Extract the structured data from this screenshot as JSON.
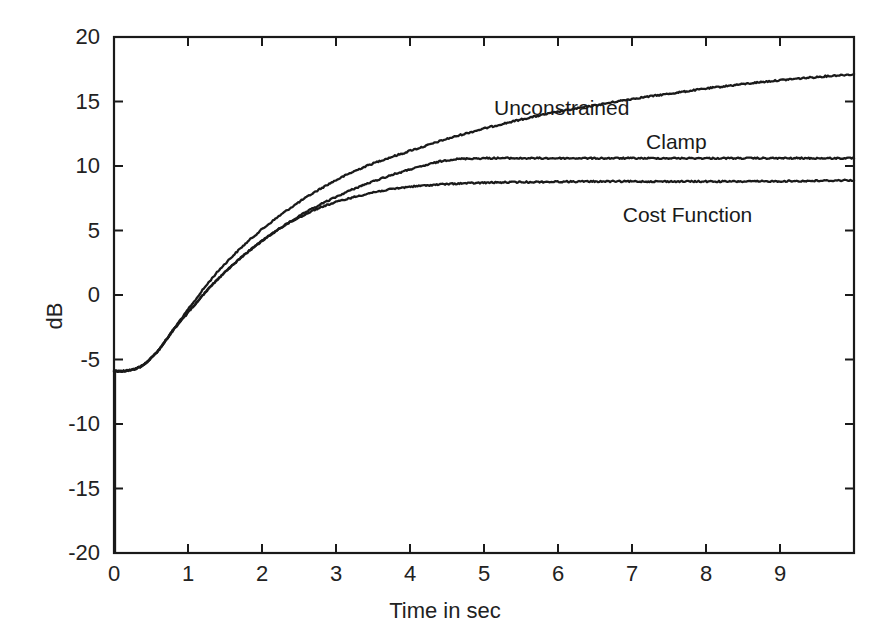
{
  "chart_data": {
    "type": "line",
    "title": "",
    "xlabel": "Time in sec",
    "ylabel": "dB",
    "xlim": [
      0,
      10
    ],
    "ylim": [
      -20,
      20
    ],
    "xticks": [
      0,
      1,
      2,
      3,
      4,
      5,
      6,
      7,
      8,
      9
    ],
    "xtick_labels": [
      "0",
      "1",
      "2",
      "3",
      "4",
      "5",
      "6",
      "7",
      "8",
      "9"
    ],
    "yticks": [
      -20,
      -15,
      -10,
      -5,
      0,
      5,
      10,
      15,
      20
    ],
    "ytick_labels": [
      "-20",
      "-15",
      "-10",
      "-5",
      "0",
      "5",
      "10",
      "15",
      "20"
    ],
    "grid": false,
    "legend_position": "inline-annotations",
    "line_color": "#1a1a1a",
    "background": "#ffffff",
    "x": [
      0,
      0.1,
      0.2,
      0.3,
      0.4,
      0.5,
      0.6,
      0.7,
      0.8,
      0.9,
      1.0,
      1.2,
      1.4,
      1.6,
      1.8,
      2.0,
      2.25,
      2.5,
      2.75,
      3.0,
      3.25,
      3.5,
      3.75,
      4.0,
      4.5,
      5.0,
      5.5,
      6.0,
      6.5,
      7.0,
      7.5,
      8.0,
      8.5,
      9.0,
      9.5,
      10.0
    ],
    "series": [
      {
        "name": "Unconstrained",
        "label": "Unconstrained",
        "values": [
          -5.9,
          -5.9,
          -5.85,
          -5.7,
          -5.4,
          -4.9,
          -4.3,
          -3.5,
          -2.7,
          -1.9,
          -1.1,
          0.4,
          1.8,
          3.0,
          4.1,
          5.1,
          6.2,
          7.2,
          8.1,
          8.9,
          9.6,
          10.2,
          10.7,
          11.2,
          12.1,
          12.9,
          13.6,
          14.2,
          14.7,
          15.2,
          15.6,
          16.0,
          16.35,
          16.65,
          16.9,
          17.1
        ]
      },
      {
        "name": "Clamp",
        "label": "Clamp",
        "values": [
          -5.9,
          -5.9,
          -5.85,
          -5.7,
          -5.4,
          -4.9,
          -4.3,
          -3.5,
          -2.75,
          -2.0,
          -1.3,
          0.0,
          1.2,
          2.3,
          3.3,
          4.2,
          5.2,
          6.1,
          6.9,
          7.6,
          8.25,
          8.8,
          9.3,
          9.75,
          10.45,
          10.6,
          10.6,
          10.6,
          10.6,
          10.6,
          10.6,
          10.6,
          10.6,
          10.6,
          10.6,
          10.6
        ]
      },
      {
        "name": "Cost Function",
        "label": "Cost Function",
        "values": [
          -5.9,
          -5.9,
          -5.85,
          -5.7,
          -5.4,
          -4.9,
          -4.3,
          -3.5,
          -2.75,
          -2.0,
          -1.3,
          0.0,
          1.2,
          2.3,
          3.3,
          4.2,
          5.2,
          6.0,
          6.7,
          7.2,
          7.6,
          7.95,
          8.2,
          8.4,
          8.6,
          8.7,
          8.75,
          8.78,
          8.8,
          8.8,
          8.8,
          8.8,
          8.8,
          8.82,
          8.85,
          8.9
        ]
      }
    ],
    "annotations": [
      {
        "text": "Unconstrained",
        "x": 6.05,
        "y": 14.6
      },
      {
        "text": "Clamp",
        "x": 7.6,
        "y": 11.9
      },
      {
        "text": "Cost Function",
        "x": 7.75,
        "y": 6.3
      }
    ]
  }
}
